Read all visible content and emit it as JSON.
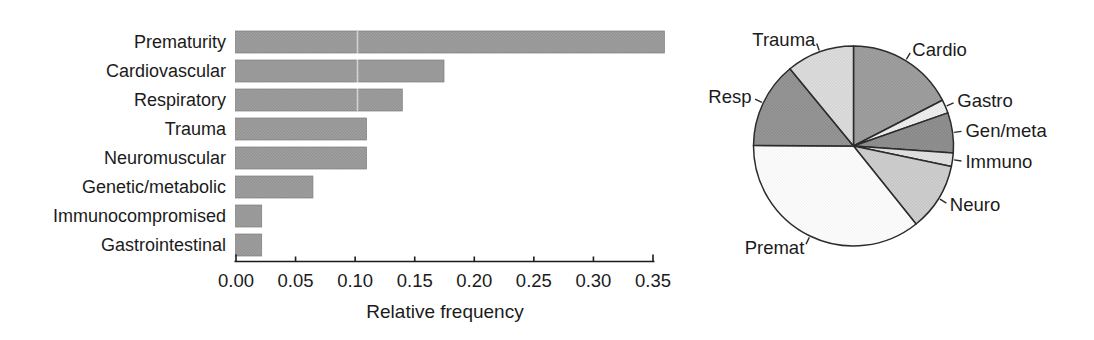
{
  "figure": {
    "background": "#ffffff",
    "ink": "#1b1b1b",
    "outline_color": "#2b2b2b"
  },
  "chart_data": [
    {
      "type": "bar",
      "orientation": "horizontal",
      "title": "",
      "categories": [
        "Prematurity",
        "Cardiovascular",
        "Respiratory",
        "Trauma",
        "Neuromuscular",
        "Genetic/metabolic",
        "Immunocompromised",
        "Gastrointestinal"
      ],
      "values": [
        0.36,
        0.175,
        0.14,
        0.11,
        0.11,
        0.065,
        0.022,
        0.022
      ],
      "xlabel": "Relative frequency",
      "ylabel": "",
      "xlim": [
        0,
        0.35
      ],
      "xtick_labels": [
        "0.00",
        "0.05",
        "0.10",
        "0.15",
        "0.20",
        "0.25",
        "0.30",
        "0.35"
      ],
      "xtick_values": [
        0,
        0.05,
        0.1,
        0.15,
        0.2,
        0.25,
        0.3,
        0.35
      ],
      "grid": false,
      "bar_color": "#9a9a9a",
      "bar_texture": "halftone"
    },
    {
      "type": "pie",
      "title": "",
      "labels": [
        "Cardio",
        "Gastro",
        "Gen/meta",
        "Immuno",
        "Neuro",
        "Premat",
        "Resp",
        "Trauma"
      ],
      "values": [
        0.175,
        0.022,
        0.065,
        0.022,
        0.11,
        0.36,
        0.14,
        0.11
      ],
      "colors": [
        "#9c9c9c",
        "#ebebeb",
        "#8d8d8d",
        "#dedede",
        "#cbcbcb",
        "#fbfbfb",
        "#929292",
        "#d9d9d9"
      ],
      "start_angle": "12-oclock",
      "direction": "clockwise",
      "legend_position": "labels-with-leader-lines"
    }
  ]
}
